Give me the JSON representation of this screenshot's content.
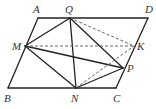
{
  "figure": {
    "type": "parallelogram-geometry",
    "points": {
      "A": {
        "label": "A",
        "x": 38,
        "y": 18
      },
      "Q": {
        "label": "Q",
        "x": 70,
        "y": 18
      },
      "D": {
        "label": "D",
        "x": 148,
        "y": 18
      },
      "M": {
        "label": "M",
        "x": 25,
        "y": 46
      },
      "K": {
        "label": "K",
        "x": 134,
        "y": 46
      },
      "P": {
        "label": "P",
        "x": 123,
        "y": 68
      },
      "B": {
        "label": "B",
        "x": 8,
        "y": 88
      },
      "N": {
        "label": "N",
        "x": 76,
        "y": 88
      },
      "C": {
        "label": "C",
        "x": 116,
        "y": 88
      }
    },
    "solid_segments": [
      [
        "A",
        "D"
      ],
      [
        "D",
        "C"
      ],
      [
        "C",
        "B"
      ],
      [
        "B",
        "A"
      ],
      [
        "M",
        "Q"
      ],
      [
        "Q",
        "N"
      ],
      [
        "Q",
        "P"
      ],
      [
        "M",
        "N"
      ],
      [
        "M",
        "P"
      ],
      [
        "N",
        "P"
      ]
    ],
    "dashed_segments": [
      [
        "M",
        "K"
      ],
      [
        "Q",
        "K"
      ],
      [
        "N",
        "K"
      ]
    ],
    "line_color": "#222222"
  }
}
